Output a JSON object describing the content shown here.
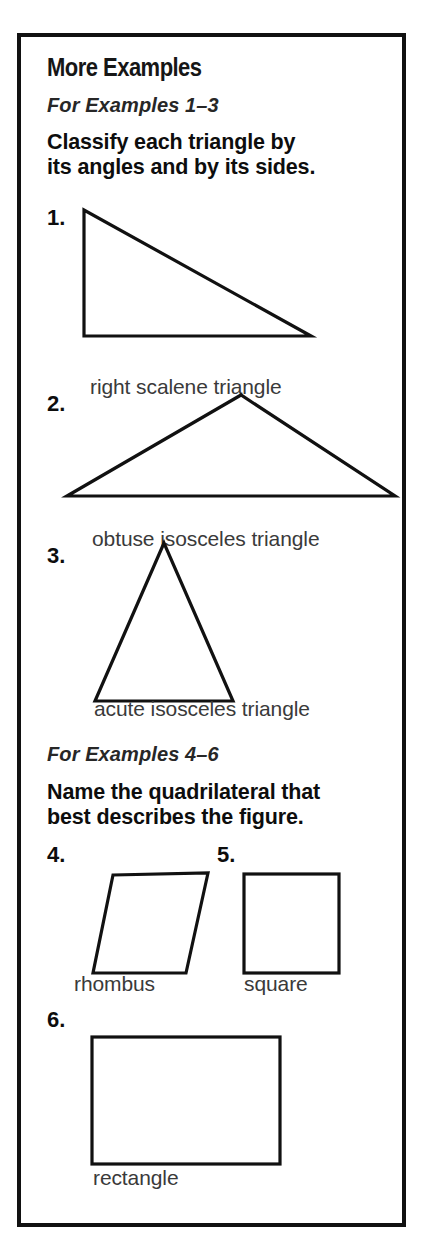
{
  "page": {
    "background_color": "#ffffff",
    "border_color": "#111111",
    "ink_color": "#1a1a1a"
  },
  "card": {
    "title": "More Examples",
    "sections": [
      {
        "id": "examples-1-3",
        "heading": "For Examples 1–3",
        "directions_line1": "Classify each triangle by",
        "directions_line2": "its angles and by its sides."
      },
      {
        "id": "examples-4-6",
        "heading": "For Examples 4–6",
        "directions_line1": "Name the quadrilateral that",
        "directions_line2": "best describes the figure."
      }
    ],
    "problems": [
      {
        "number": "1.",
        "figure": "right-scalene-triangle",
        "answer": "right scalene triangle"
      },
      {
        "number": "2.",
        "figure": "obtuse-isosceles-triangle",
        "answer": "obtuse isosceles triangle"
      },
      {
        "number": "3.",
        "figure": "acute-isosceles-triangle",
        "answer": "acute isosceles triangle"
      },
      {
        "number": "4.",
        "figure": "rhombus",
        "answer": "rhombus"
      },
      {
        "number": "5.",
        "figure": "square",
        "answer": "square"
      },
      {
        "number": "6.",
        "figure": "rectangle",
        "answer": "rectangle"
      }
    ]
  }
}
